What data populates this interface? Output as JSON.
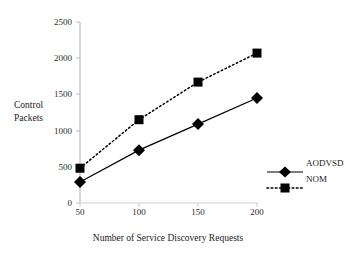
{
  "chart_data": {
    "type": "line",
    "title": "",
    "xlabel": "Number of Service Discovery Requests",
    "ylabel": "Control\nPackets",
    "ylabel_line1": "Control",
    "ylabel_line2": "Packets",
    "x": [
      50,
      100,
      150,
      200
    ],
    "xticklabels": [
      "50",
      "100",
      "150",
      "200"
    ],
    "yticks": [
      0,
      500,
      1000,
      1500,
      2000,
      2500
    ],
    "yticklabels": [
      "0",
      "500",
      "1000",
      "1500",
      "2000",
      "2500"
    ],
    "xlim": [
      50,
      200
    ],
    "ylim": [
      0,
      2500
    ],
    "grid": false,
    "legend_position": "right-bottom",
    "series": [
      {
        "name": "AODVSD",
        "values": [
          290,
          730,
          1090,
          1450
        ],
        "line_style": "solid",
        "marker": "diamond",
        "color": "#000000"
      },
      {
        "name": "NOM",
        "values": [
          480,
          1150,
          1670,
          2070
        ],
        "line_style": "dotted",
        "marker": "square",
        "color": "#000000"
      }
    ]
  },
  "legend": {
    "entries": [
      {
        "label": "AODVSD",
        "marker": "diamond-marker",
        "line_style": "solid"
      },
      {
        "label": "NOM",
        "marker": "square-marker",
        "line_style": "dotted"
      }
    ]
  },
  "colors": {
    "axis": "#b8b8b8",
    "ink": "#000000",
    "background": "#ffffff"
  }
}
